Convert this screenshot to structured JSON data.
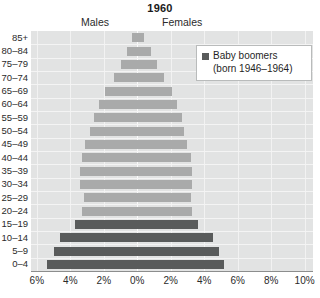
{
  "chart_data": {
    "type": "bar",
    "subtype": "population-pyramid",
    "title": "1960",
    "xlabel": "",
    "ylabel": "",
    "grid": true,
    "legend_position": "top-right",
    "left_side_label": "Males",
    "right_side_label": "Females",
    "categories": [
      "85+",
      "80–84",
      "75–79",
      "70–74",
      "65–69",
      "60–64",
      "55–59",
      "50–54",
      "45–49",
      "40–44",
      "35–39",
      "30–34",
      "25–29",
      "20–24",
      "15–19",
      "10–14",
      "5–9",
      "0–4"
    ],
    "series": [
      {
        "name": "Males",
        "side": "left",
        "values": [
          0.3,
          0.6,
          1.0,
          1.4,
          1.9,
          2.3,
          2.6,
          2.8,
          3.1,
          3.3,
          3.4,
          3.4,
          3.2,
          3.3,
          3.7,
          4.6,
          5.0,
          5.4
        ]
      },
      {
        "name": "Females",
        "side": "right",
        "values": [
          0.4,
          0.8,
          1.2,
          1.6,
          2.1,
          2.4,
          2.7,
          2.8,
          3.0,
          3.2,
          3.3,
          3.3,
          3.2,
          3.3,
          3.6,
          4.5,
          4.9,
          5.2
        ]
      }
    ],
    "highlight": {
      "label": "Baby boomers",
      "sublabel": "(born 1946–1964)",
      "color": "#595b5b",
      "categories": [
        "15–19",
        "10–14",
        "5–9",
        "0–4"
      ]
    },
    "base_color": "#a9aaaa",
    "xticks": [
      {
        "label": "6%",
        "value": -6
      },
      {
        "label": "4%",
        "value": -4
      },
      {
        "label": "2%",
        "value": -2
      },
      {
        "label": "0%",
        "value": 0
      },
      {
        "label": "2%",
        "value": 2
      },
      {
        "label": "4%",
        "value": 4
      },
      {
        "label": "6%",
        "value": 6
      },
      {
        "label": "8%",
        "value": 8
      },
      {
        "label": "10%",
        "value": 10
      }
    ],
    "xlim": [
      -6.35,
      10.5
    ],
    "plot_background": "#e2e3e3"
  }
}
